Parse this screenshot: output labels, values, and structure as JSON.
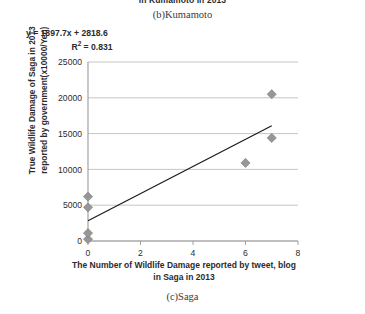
{
  "figure": {
    "top_caption_clipped": "in Kumamoto in 2013",
    "panel_b_label": "(b)Kumamoto",
    "panel_c_label": "(c)Saga"
  },
  "annotations": {
    "equation": "y = 1897.7x + 2818.6",
    "r_squared_prefix": "R",
    "r_squared_sup": "2",
    "r_squared_value": " = 0.831"
  },
  "colors": {
    "marker": "#969696",
    "marker_stroke": "#7d7d7d",
    "trendline": "#1a1a1a",
    "gridline": "#bfbfbf",
    "axis": "#9a9a9a",
    "text": "#2b2b2b"
  },
  "chart_data": {
    "type": "scatter",
    "title": "",
    "xlabel_line1": "The Number of Wildlife Damage reported by tweet, blog",
    "xlabel_line2": "in Saga in 2013",
    "ylabel_line1": "True Wildlife Damage of Saga in 2013",
    "ylabel_line2": "reported by government(x10000/Yen)",
    "xlim": [
      0,
      8
    ],
    "ylim": [
      0,
      25000
    ],
    "xticks": [
      0,
      2,
      4,
      6,
      8
    ],
    "yticks": [
      0,
      5000,
      10000,
      15000,
      20000,
      25000
    ],
    "grid": "horizontal",
    "legend": "none",
    "points": [
      {
        "x": 0,
        "y": 250
      },
      {
        "x": 0,
        "y": 1100
      },
      {
        "x": 0,
        "y": 4700
      },
      {
        "x": 0,
        "y": 6200
      },
      {
        "x": 6,
        "y": 10900
      },
      {
        "x": 7,
        "y": 14400
      },
      {
        "x": 7,
        "y": 20500
      }
    ],
    "trendline": {
      "slope": 1897.7,
      "intercept": 2818.6,
      "r_squared": 0.831,
      "x_start": 0,
      "x_end": 7.0
    }
  }
}
